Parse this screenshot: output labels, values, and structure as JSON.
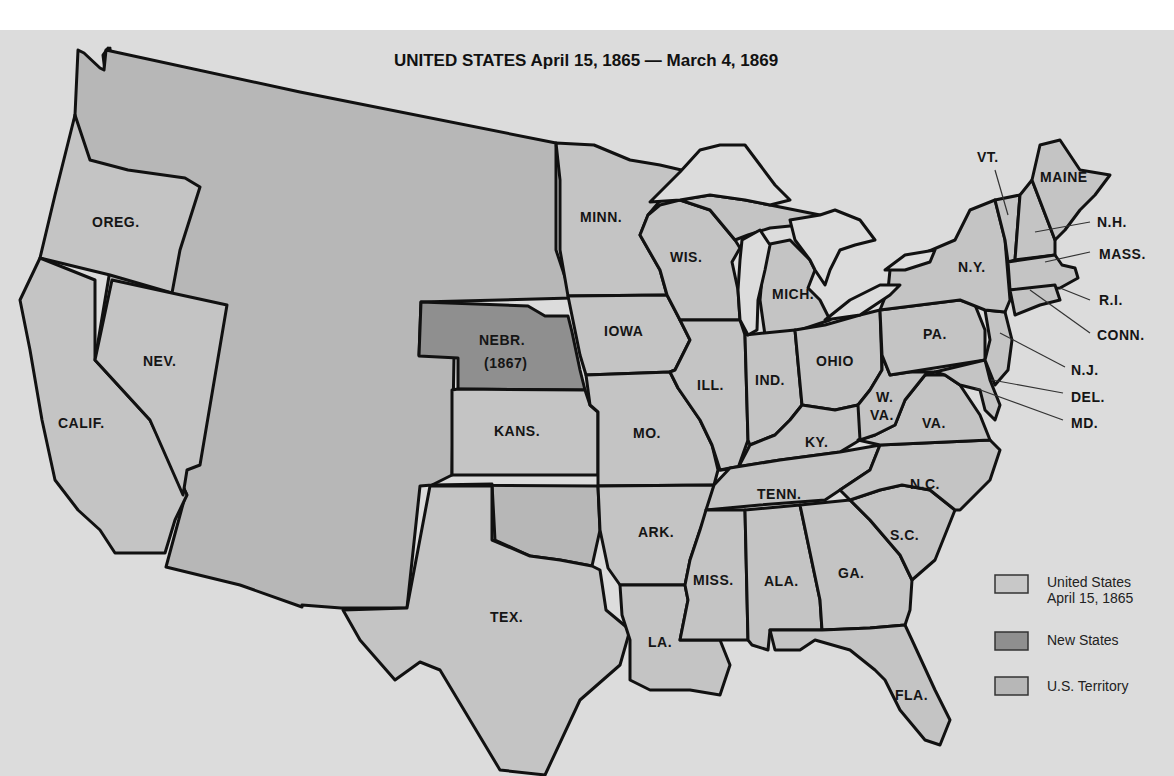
{
  "title": "UNITED STATES April 15, 1865 — March 4, 1869",
  "colors": {
    "background": "#dcdcdc",
    "states_1865": "#c4c4c4",
    "new_states": "#8f8f8f",
    "territory": "#b7b7b7",
    "border": "#111111"
  },
  "labels": {
    "oreg": "OREG.",
    "calif": "CALIF.",
    "nev": "NEV.",
    "nebr": "NEBR.",
    "nebr_year": "(1867)",
    "kans": "KANS.",
    "tex": "TEX.",
    "minn": "MINN.",
    "iowa": "IOWA",
    "mo": "MO.",
    "ark": "ARK.",
    "la": "LA.",
    "wis": "WIS.",
    "ill": "ILL.",
    "mich": "MICH.",
    "ind": "IND.",
    "ohio": "OHIO",
    "ky": "KY.",
    "tenn": "TENN.",
    "miss": "MISS.",
    "ala": "ALA.",
    "ga": "GA.",
    "fla": "FLA.",
    "sc": "S.C.",
    "nc": "N.C.",
    "va": "VA.",
    "wva_1": "W.",
    "wva_2": "VA.",
    "pa": "PA.",
    "ny": "N.Y.",
    "vt": "VT.",
    "maine": "MAINE",
    "nh": "N.H.",
    "mass": "MASS.",
    "ri": "R.I.",
    "conn": "CONN.",
    "nj": "N.J.",
    "del": "DEL.",
    "md": "MD."
  },
  "legend": [
    {
      "line1": "United States",
      "line2": "April 15, 1865",
      "swatch": "states_1865"
    },
    {
      "line1": "New States",
      "line2": "",
      "swatch": "new_states"
    },
    {
      "line1": "U.S. Territory",
      "line2": "",
      "swatch": "territory"
    }
  ]
}
